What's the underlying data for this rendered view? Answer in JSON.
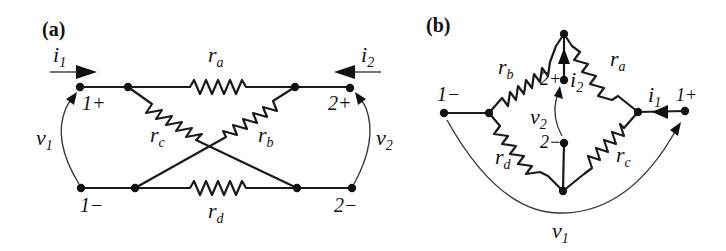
{
  "figure": {
    "panels": [
      {
        "id": "a",
        "title": "(a)",
        "ports": {
          "port1_plus": "1+",
          "port1_minus": "1−",
          "port2_plus": "2+",
          "port2_minus": "2−"
        },
        "currents": {
          "i1": {
            "base": "i",
            "sub": "1"
          },
          "i2": {
            "base": "i",
            "sub": "2"
          }
        },
        "voltages": {
          "v1": {
            "base": "v",
            "sub": "1"
          },
          "v2": {
            "base": "v",
            "sub": "2"
          }
        },
        "resistors": {
          "ra": {
            "base": "r",
            "sub": "a"
          },
          "rb": {
            "base": "r",
            "sub": "b"
          },
          "rc": {
            "base": "r",
            "sub": "c"
          },
          "rd": {
            "base": "r",
            "sub": "d"
          }
        }
      },
      {
        "id": "b",
        "title": "(b)",
        "ports": {
          "port1_plus": "1+",
          "port1_minus": "1−",
          "port2_plus": "2+",
          "port2_minus": "2−"
        },
        "currents": {
          "i1": {
            "base": "i",
            "sub": "1"
          },
          "i2": {
            "base": "i",
            "sub": "2"
          }
        },
        "voltages": {
          "v1": {
            "base": "v",
            "sub": "1"
          },
          "v2": {
            "base": "v",
            "sub": "2"
          }
        },
        "resistors": {
          "ra": {
            "base": "r",
            "sub": "a"
          },
          "rb": {
            "base": "r",
            "sub": "b"
          },
          "rc": {
            "base": "r",
            "sub": "c"
          },
          "rd": {
            "base": "r",
            "sub": "d"
          }
        }
      }
    ]
  }
}
